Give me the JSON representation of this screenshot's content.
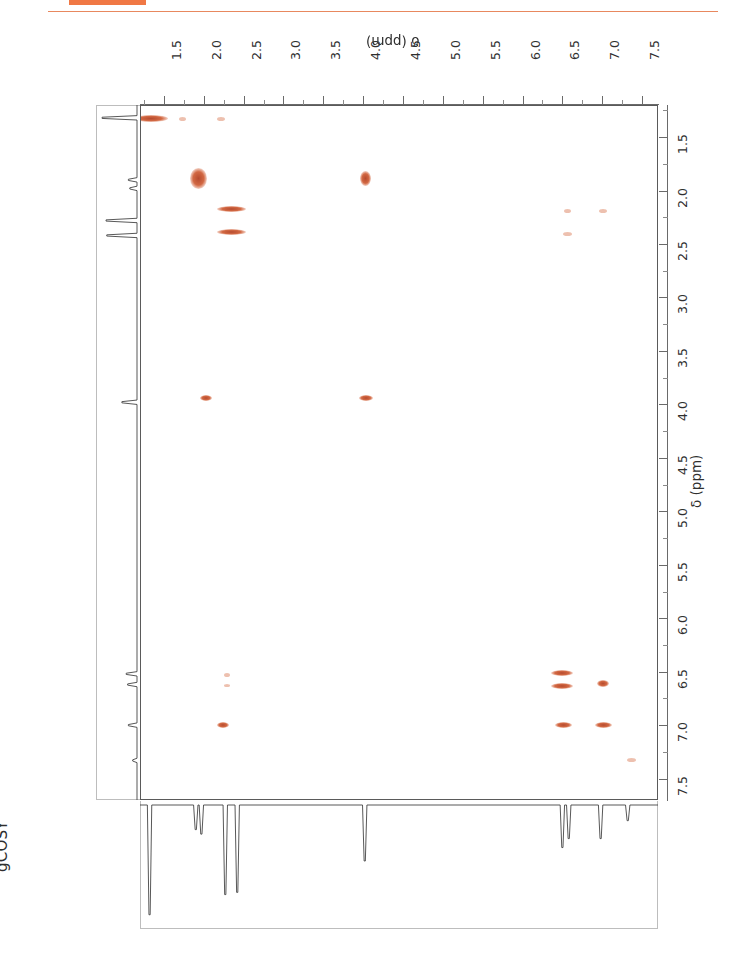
{
  "page": {
    "figure_caption": "gCOSY",
    "accent_color": "#f07845",
    "rule_color": "#e8885e"
  },
  "chart_data": {
    "type": "scatter",
    "subtype": "2d-nmr-cosy-contour",
    "title": "gCOSY",
    "orientation": "page rotated 180 degrees",
    "xlabel": "δ (ppm)",
    "ylabel": "δ (ppm)",
    "xlim": [
      1.2,
      7.7
    ],
    "ylim": [
      1.2,
      7.7
    ],
    "x_axis_position": "top",
    "y_axis_position": "right",
    "x_direction": "increasing left to right",
    "y_direction": "increasing top to bottom",
    "grid": false,
    "legend": null,
    "xticks": [
      "1.5",
      "2.0",
      "2.5",
      "3.0",
      "3.5",
      "4.0",
      "4.5",
      "5.0",
      "5.5",
      "6.0",
      "6.5",
      "7.0",
      "7.5"
    ],
    "yticks": [
      "1.5",
      "2.0",
      "2.5",
      "3.0",
      "3.5",
      "4.0",
      "4.5",
      "5.0",
      "5.5",
      "6.0",
      "6.5",
      "7.0",
      "7.5"
    ],
    "xtick_values": [
      1.5,
      2.0,
      2.5,
      3.0,
      3.5,
      4.0,
      4.5,
      5.0,
      5.5,
      6.0,
      6.5,
      7.0,
      7.5
    ],
    "ytick_values": [
      1.5,
      2.0,
      2.5,
      3.0,
      3.5,
      4.0,
      4.5,
      5.0,
      5.5,
      6.0,
      6.5,
      7.0,
      7.5
    ],
    "contour_color": "#c0492a",
    "peaks": [
      {
        "x": 1.32,
        "y": 1.32,
        "w": 34,
        "h": 7,
        "kind": "diagonal",
        "intensity": "strong"
      },
      {
        "x": 1.72,
        "y": 1.32,
        "w": 7,
        "h": 4,
        "kind": "cross",
        "intensity": "faint"
      },
      {
        "x": 2.2,
        "y": 1.32,
        "w": 8,
        "h": 4,
        "kind": "cross",
        "intensity": "faint"
      },
      {
        "x": 1.92,
        "y": 1.88,
        "w": 17,
        "h": 21,
        "kind": "diagonal",
        "intensity": "strong"
      },
      {
        "x": 4.02,
        "y": 1.88,
        "w": 11,
        "h": 15,
        "kind": "cross",
        "intensity": "strong"
      },
      {
        "x": 2.33,
        "y": 2.16,
        "w": 29,
        "h": 6,
        "kind": "diagonal",
        "intensity": "strong"
      },
      {
        "x": 2.33,
        "y": 2.38,
        "w": 29,
        "h": 6,
        "kind": "diagonal",
        "intensity": "strong"
      },
      {
        "x": 6.55,
        "y": 2.18,
        "w": 7,
        "h": 4,
        "kind": "cross",
        "intensity": "faint"
      },
      {
        "x": 7.0,
        "y": 2.18,
        "w": 8,
        "h": 4,
        "kind": "cross",
        "intensity": "faint"
      },
      {
        "x": 6.55,
        "y": 2.4,
        "w": 9,
        "h": 4,
        "kind": "cross",
        "intensity": "faint"
      },
      {
        "x": 2.02,
        "y": 3.93,
        "w": 12,
        "h": 6,
        "kind": "cross",
        "intensity": "medium"
      },
      {
        "x": 4.02,
        "y": 3.93,
        "w": 14,
        "h": 6,
        "kind": "diagonal",
        "intensity": "medium"
      },
      {
        "x": 2.28,
        "y": 6.52,
        "w": 6,
        "h": 4,
        "kind": "cross",
        "intensity": "faint"
      },
      {
        "x": 2.28,
        "y": 6.62,
        "w": 6,
        "h": 3,
        "kind": "cross",
        "intensity": "faint"
      },
      {
        "x": 6.48,
        "y": 6.5,
        "w": 22,
        "h": 6,
        "kind": "diagonal",
        "intensity": "strong"
      },
      {
        "x": 6.48,
        "y": 6.62,
        "w": 22,
        "h": 6,
        "kind": "diagonal",
        "intensity": "strong"
      },
      {
        "x": 7.0,
        "y": 6.6,
        "w": 12,
        "h": 7,
        "kind": "cross",
        "intensity": "strong"
      },
      {
        "x": 2.23,
        "y": 6.99,
        "w": 12,
        "h": 6,
        "kind": "cross",
        "intensity": "medium"
      },
      {
        "x": 6.5,
        "y": 6.99,
        "w": 17,
        "h": 6,
        "kind": "cross",
        "intensity": "strong"
      },
      {
        "x": 7.0,
        "y": 6.99,
        "w": 17,
        "h": 6,
        "kind": "diagonal",
        "intensity": "strong"
      },
      {
        "x": 7.35,
        "y": 7.32,
        "w": 9,
        "h": 4,
        "kind": "diagonal",
        "intensity": "faint"
      }
    ],
    "projection_f2_peaks": [
      {
        "ppm": 1.32,
        "height": 0.98
      },
      {
        "ppm": 1.9,
        "height": 0.22
      },
      {
        "ppm": 1.97,
        "height": 0.26
      },
      {
        "ppm": 2.27,
        "height": 0.8
      },
      {
        "ppm": 2.42,
        "height": 0.78
      },
      {
        "ppm": 4.02,
        "height": 0.5
      },
      {
        "ppm": 6.5,
        "height": 0.38
      },
      {
        "ppm": 6.58,
        "height": 0.3
      },
      {
        "ppm": 6.98,
        "height": 0.3
      },
      {
        "ppm": 7.32,
        "height": 0.14
      }
    ],
    "projection_f1_peaks": [
      {
        "ppm": 1.32,
        "height": 0.97
      },
      {
        "ppm": 1.9,
        "height": 0.24
      },
      {
        "ppm": 1.98,
        "height": 0.2
      },
      {
        "ppm": 2.28,
        "height": 0.86
      },
      {
        "ppm": 2.42,
        "height": 0.84
      },
      {
        "ppm": 3.98,
        "height": 0.42
      },
      {
        "ppm": 6.52,
        "height": 0.3
      },
      {
        "ppm": 6.62,
        "height": 0.26
      },
      {
        "ppm": 7.0,
        "height": 0.24
      },
      {
        "ppm": 7.33,
        "height": 0.12
      }
    ]
  }
}
